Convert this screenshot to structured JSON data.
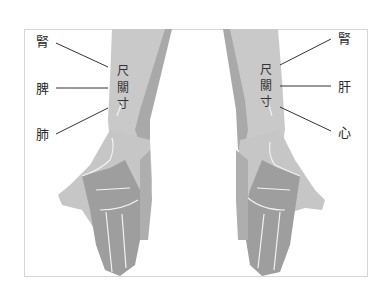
{
  "diagram": {
    "left_wrist": {
      "positions": [
        "尺",
        "關",
        "寸"
      ],
      "organs": [
        {
          "position": "尺",
          "organ": "腎"
        },
        {
          "position": "關",
          "organ": "脾"
        },
        {
          "position": "寸",
          "organ": "肺"
        }
      ]
    },
    "right_wrist": {
      "positions": [
        "尺",
        "關",
        "寸"
      ],
      "organs": [
        {
          "position": "尺",
          "organ": "腎"
        },
        {
          "position": "關",
          "organ": "肝"
        },
        {
          "position": "寸",
          "organ": "心"
        }
      ]
    },
    "colors": {
      "arm_light": "#c9c9c9",
      "arm_dark": "#a9a9a9",
      "palm": "#9e9e9e",
      "crease": "#f2f2f2",
      "frame": "#d6d6d6",
      "leader_line": "#333333"
    }
  }
}
